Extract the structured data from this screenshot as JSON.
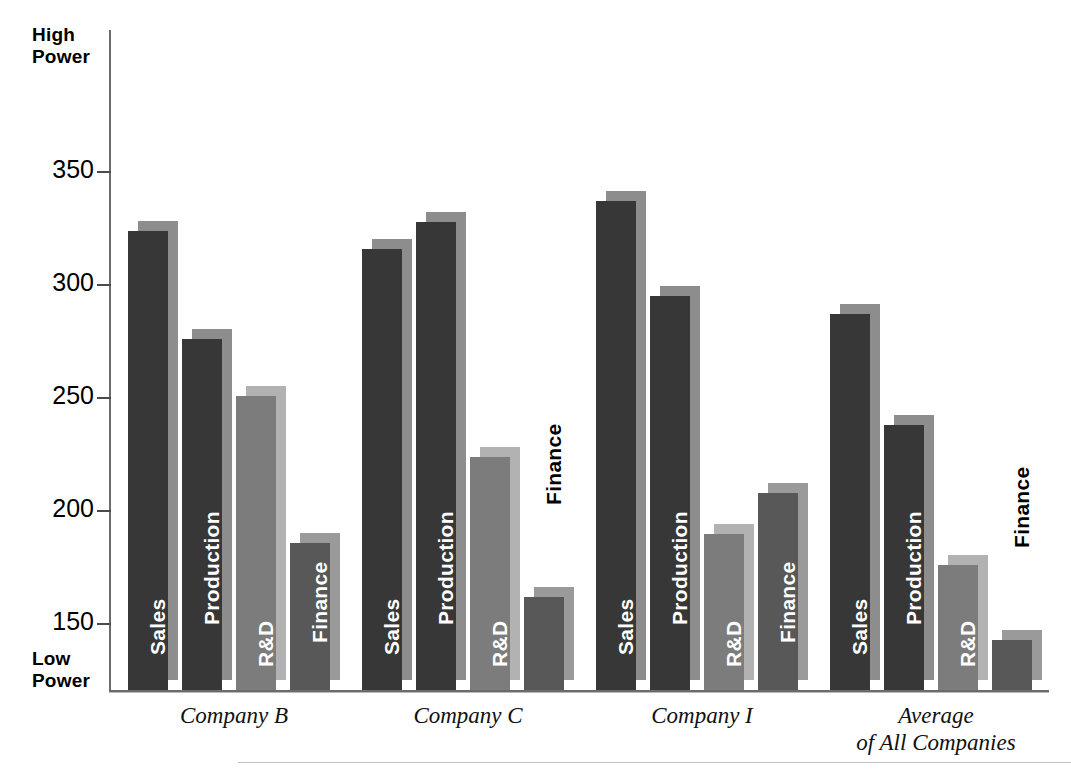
{
  "chart_data": {
    "type": "bar",
    "title": "",
    "xlabel": "",
    "ylabel": "",
    "axis_top_label": "High\nPower",
    "axis_bottom_label": "Low\nPower",
    "ylim": [
      121,
      365
    ],
    "yticks": [
      350,
      300,
      250,
      200,
      150
    ],
    "ytick_labels": [
      "350",
      "300",
      "250",
      "200",
      "150"
    ],
    "grid": false,
    "legend": "none",
    "categories": [
      "Company B",
      "Company C",
      "Company I",
      "Average\nof All Companies"
    ],
    "series": [
      {
        "name": "Sales",
        "values": [
          324,
          316,
          337,
          287
        ]
      },
      {
        "name": "Production",
        "values": [
          276,
          328,
          295,
          238
        ]
      },
      {
        "name": "R&D",
        "values": [
          251,
          224,
          190,
          176
        ]
      },
      {
        "name": "Finance",
        "values": [
          186,
          162,
          208,
          143
        ]
      }
    ],
    "series_colors": [
      "#373737",
      "#373737",
      "#7c7c7c",
      "#585858"
    ],
    "bar_label_position": [
      "inside",
      "inside",
      "inside",
      "inside-or-above"
    ]
  },
  "groups": [
    {
      "caption": "Company B",
      "bars": [
        {
          "label": "Sales",
          "value": 324,
          "label_placement": "inside"
        },
        {
          "label": "Production",
          "value": 276,
          "label_placement": "inside"
        },
        {
          "label": "R&D",
          "value": 251,
          "label_placement": "inside"
        },
        {
          "label": "Finance",
          "value": 186,
          "label_placement": "inside"
        }
      ]
    },
    {
      "caption": "Company C",
      "bars": [
        {
          "label": "Sales",
          "value": 316,
          "label_placement": "inside"
        },
        {
          "label": "Production",
          "value": 328,
          "label_placement": "inside"
        },
        {
          "label": "R&D",
          "value": 224,
          "label_placement": "inside"
        },
        {
          "label": "Finance",
          "value": 162,
          "label_placement": "above"
        }
      ]
    },
    {
      "caption": "Company I",
      "bars": [
        {
          "label": "Sales",
          "value": 337,
          "label_placement": "inside"
        },
        {
          "label": "Production",
          "value": 295,
          "label_placement": "inside"
        },
        {
          "label": "R&D",
          "value": 190,
          "label_placement": "inside"
        },
        {
          "label": "Finance",
          "value": 208,
          "label_placement": "inside"
        }
      ]
    },
    {
      "caption": "Average\nof All Companies",
      "bars": [
        {
          "label": "Sales",
          "value": 287,
          "label_placement": "inside"
        },
        {
          "label": "Production",
          "value": 238,
          "label_placement": "inside"
        },
        {
          "label": "R&D",
          "value": 176,
          "label_placement": "inside"
        },
        {
          "label": "Finance",
          "value": 143,
          "label_placement": "above"
        }
      ]
    }
  ],
  "colors": {
    "bar_sales": "#373737",
    "bar_production": "#373737",
    "bar_rd": "#7c7c7c",
    "bar_finance": "#585858",
    "bar_sales_side": "#8d8d8d",
    "bar_rd_side": "#b2b2b2",
    "bar_finance_side": "#9a9a9a",
    "axis": "#6b6b6b",
    "text": "#000000"
  }
}
